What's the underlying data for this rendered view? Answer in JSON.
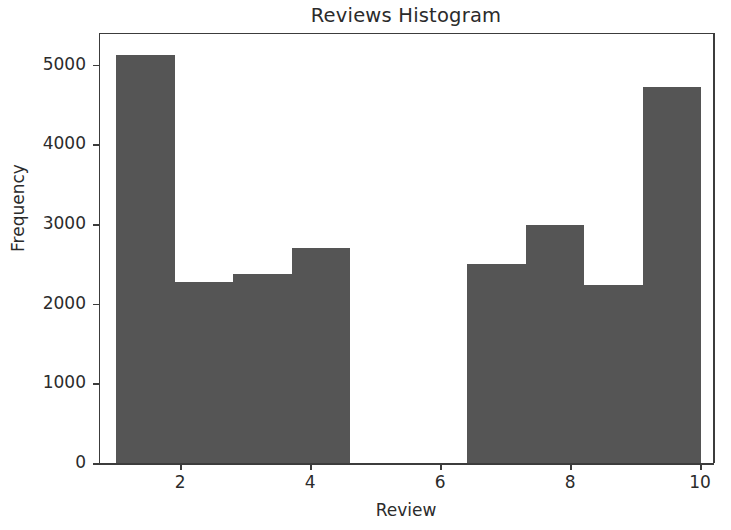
{
  "chart_data": {
    "type": "bar",
    "title": "Reviews Histogram",
    "xlabel": "Review",
    "ylabel": "Frequency",
    "xlim": [
      0.75,
      10.2
    ],
    "ylim": [
      0,
      5400
    ],
    "grid": false,
    "legend": null,
    "bar_color": "#555555",
    "axis_color": "#3c3c3c",
    "background": "#ffffff",
    "xticks": [
      2,
      4,
      6,
      8,
      10
    ],
    "xtick_labels": [
      "2",
      "4",
      "6",
      "8",
      "10"
    ],
    "yticks": [
      0,
      1000,
      2000,
      3000,
      4000,
      5000
    ],
    "ytick_labels": [
      "0",
      "1000",
      "2000",
      "3000",
      "4000",
      "5000"
    ],
    "bin_edges": [
      1.0,
      1.9,
      2.8,
      3.7,
      4.6,
      5.5,
      6.4,
      7.3,
      8.2,
      9.1,
      10.0
    ],
    "values": [
      5140,
      2290,
      2390,
      2710,
      0,
      0,
      2510,
      3000,
      2250,
      4730
    ],
    "bars": [
      {
        "bin_start": 1.0,
        "bin_end": 1.9,
        "value": 5140
      },
      {
        "bin_start": 1.9,
        "bin_end": 2.8,
        "value": 2290
      },
      {
        "bin_start": 2.8,
        "bin_end": 3.7,
        "value": 2390
      },
      {
        "bin_start": 3.7,
        "bin_end": 4.6,
        "value": 2710
      },
      {
        "bin_start": 4.6,
        "bin_end": 5.5,
        "value": 0
      },
      {
        "bin_start": 5.5,
        "bin_end": 6.4,
        "value": 0
      },
      {
        "bin_start": 6.4,
        "bin_end": 7.3,
        "value": 2510
      },
      {
        "bin_start": 7.3,
        "bin_end": 8.2,
        "value": 3000
      },
      {
        "bin_start": 8.2,
        "bin_end": 9.1,
        "value": 2250
      },
      {
        "bin_start": 9.1,
        "bin_end": 10.0,
        "value": 4730
      }
    ]
  }
}
